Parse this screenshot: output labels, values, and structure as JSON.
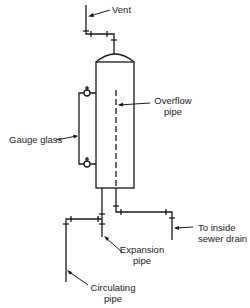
{
  "diagram": {
    "type": "expansion-tank-piping",
    "labels": {
      "vent": "Vent",
      "overflow_line1": "Overflow",
      "overflow_line2": "pipe",
      "gauge_glass": "Gauge glass",
      "drain_line1": "To inside",
      "drain_line2": "sewer drain",
      "expansion_line1": "Expansion",
      "expansion_line2": "pipe",
      "circulating_line1": "Circulating",
      "circulating_line2": "pipe"
    },
    "colors": {
      "line": "#1a1a1a",
      "background": "#ffffff"
    },
    "components": [
      {
        "name": "tank",
        "shape": "vertical cylinder with domed top"
      },
      {
        "name": "vent-pipe"
      },
      {
        "name": "gauge-glass",
        "valves": 2
      },
      {
        "name": "overflow-pipe",
        "style": "dashed inside tank"
      },
      {
        "name": "expansion-pipe"
      },
      {
        "name": "circulating-pipe"
      },
      {
        "name": "drain-pipe"
      }
    ]
  }
}
